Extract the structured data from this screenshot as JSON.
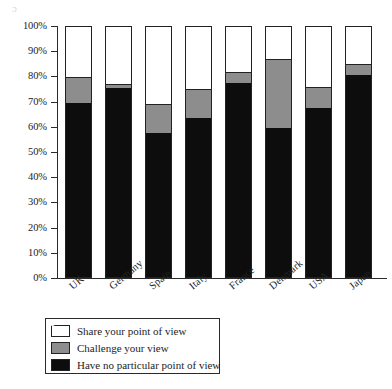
{
  "chart_data": {
    "type": "bar",
    "subtype": "stacked-100-percent",
    "title": "",
    "xlabel": "",
    "ylabel": "",
    "ylim": [
      0,
      100
    ],
    "ytick_labels": [
      "100%",
      "90%",
      "80%",
      "70%",
      "60%",
      "50%",
      "40%",
      "30%",
      "20%",
      "10%",
      "0%"
    ],
    "ytick_values": [
      100,
      90,
      80,
      70,
      60,
      50,
      40,
      30,
      20,
      10,
      0
    ],
    "grid": false,
    "legend_position": "bottom-left",
    "categories": [
      "UK",
      "Germany",
      "Spain",
      "Italy",
      "France",
      "Denmark",
      "USA",
      "Japan"
    ],
    "series": [
      {
        "name": "Share your point of view",
        "color": "#ffffff",
        "values": [
          20,
          23,
          31,
          25,
          18,
          13,
          24,
          15
        ]
      },
      {
        "name": "Challenge your view",
        "color": "#8d8d8d",
        "values": [
          10,
          1,
          11,
          11,
          4,
          27,
          8,
          4
        ]
      },
      {
        "name": "Have no particular point of view",
        "color": "#0d0d0d",
        "values": [
          70,
          76,
          58,
          64,
          78,
          60,
          68,
          81
        ]
      }
    ],
    "stack_order_bottom_to_top": [
      "Have no particular point of view",
      "Challenge your view",
      "Share your point of view"
    ],
    "cumulative_tops": {
      "black": [
        70,
        76,
        58,
        64,
        78,
        60,
        68,
        81
      ],
      "gray": [
        80,
        77,
        69,
        75,
        82,
        87,
        76,
        85
      ],
      "white": [
        100,
        100,
        100,
        100,
        100,
        100,
        100,
        100
      ]
    }
  },
  "legend": {
    "items": [
      {
        "label": "Share your point of view",
        "swatch": "white"
      },
      {
        "label": "Challenge your view",
        "swatch": "gray"
      },
      {
        "label": "Have no particular point of view",
        "swatch": "black"
      }
    ]
  },
  "colors": {
    "share": "#ffffff",
    "challenge": "#8d8d8d",
    "no_view": "#0d0d0d",
    "axis": "#2a2a2a",
    "background": "#ffffff"
  }
}
